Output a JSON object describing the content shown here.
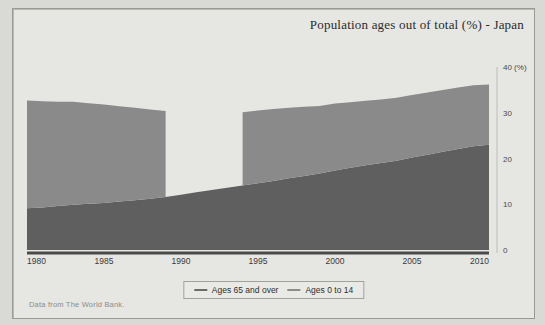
{
  "chart_data": {
    "type": "area",
    "stacked": true,
    "title": "Population ages out of total (%) - Japan",
    "xlabel": "",
    "ylabel": "",
    "yunit": "(%)",
    "ylim": [
      0,
      40
    ],
    "xlim": [
      1980,
      2010
    ],
    "yticks": [
      0,
      10,
      20,
      30,
      40
    ],
    "ytick_labels": [
      "0",
      "10",
      "20",
      "30",
      "40 (%)"
    ],
    "xticks": [
      1980,
      1985,
      1990,
      1995,
      2000,
      2005,
      2010
    ],
    "xtick_labels": [
      "1980",
      "1985",
      "1990",
      "1995",
      "2000",
      "2005",
      "2010"
    ],
    "grid": false,
    "legend_position": "bottom",
    "x": [
      1980,
      1981,
      1982,
      1983,
      1984,
      1985,
      1986,
      1987,
      1988,
      1989,
      1990,
      1991,
      1992,
      1993,
      1994,
      1995,
      1996,
      1997,
      1998,
      1999,
      2000,
      2001,
      2002,
      2003,
      2004,
      2005,
      2006,
      2007,
      2008,
      2009,
      2010
    ],
    "series": [
      {
        "name": "Ages 65 and over",
        "color": "#5f5f5f",
        "values": [
          9.1,
          9.3,
          9.6,
          9.9,
          10.1,
          10.3,
          10.6,
          10.9,
          11.2,
          11.6,
          12.1,
          12.6,
          13.1,
          13.6,
          14.1,
          14.6,
          15.1,
          15.7,
          16.2,
          16.7,
          17.4,
          18.0,
          18.5,
          19.0,
          19.5,
          20.2,
          20.8,
          21.5,
          22.1,
          22.7,
          23.0
        ]
      },
      {
        "name": "Ages 0 to 14",
        "color": "#8a8a8a",
        "values": [
          23.6,
          23.2,
          22.8,
          22.5,
          22.0,
          21.5,
          20.8,
          20.2,
          19.5,
          18.8,
          null,
          null,
          null,
          null,
          16.0,
          15.9,
          15.7,
          15.4,
          15.1,
          14.8,
          14.6,
          14.3,
          14.1,
          13.9,
          13.8,
          13.7,
          13.6,
          13.5,
          13.4,
          13.3,
          13.2
        ]
      }
    ]
  },
  "source_note": "Data from The World Bank.",
  "legend": {
    "items": [
      {
        "label": "Ages 65 and over",
        "swatch": "line-swatch-dark"
      },
      {
        "label": "Ages 0 to 14",
        "swatch": "line-swatch-light"
      }
    ]
  },
  "colors": {
    "page_background": "#d9d9d6",
    "panel_background": "#e6e6e2",
    "panel_border": "#9a9a95",
    "band_lower": "#5f5f5f",
    "band_upper": "#8a8a8a",
    "text": "#2a2a2a",
    "source_text": "#8d8d88"
  }
}
